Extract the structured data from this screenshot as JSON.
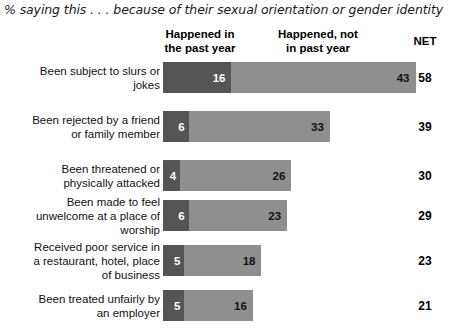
{
  "title": "% saying this . . . because of their sexual orientation or gender identity",
  "headers": {
    "happened": "Happened in\nthe past year",
    "happened_line1": "Happened in",
    "happened_line2": "the past year",
    "not_happened_line1": "Happened, not",
    "not_happened_line2": "in past year",
    "net": "NET"
  },
  "colors": {
    "past_year": "#555555",
    "not_past_year": "#8f8f8f",
    "background": "#ffffff",
    "text": "#111111"
  },
  "chart_data": {
    "type": "bar",
    "title": "% saying this . . . because of their sexual orientation or gender identity",
    "orientation": "horizontal",
    "stacked": true,
    "xlabel": "",
    "ylabel": "",
    "grid": false,
    "legend": "column-headers",
    "xlim": [
      0,
      60
    ],
    "categories": [
      "Been subject to slurs or jokes",
      "Been rejected by a friend or family member",
      "Been threatened or physically attacked",
      "Been made to feel unwelcome at a place of worship",
      "Received poor service in a restaurant, hotel, place of business",
      "Been treated unfairly by an employer"
    ],
    "series": [
      {
        "name": "Happened in the past year",
        "color": "#555555",
        "values": [
          16,
          6,
          4,
          6,
          5,
          5
        ]
      },
      {
        "name": "Happened, not in past year",
        "color": "#8f8f8f",
        "values": [
          43,
          33,
          26,
          23,
          18,
          16
        ]
      }
    ],
    "net_label": "NET",
    "net": [
      58,
      39,
      30,
      29,
      23,
      21
    ]
  },
  "rows": [
    {
      "label_line1": "Been subject to slurs or",
      "label_line2": "jokes",
      "past": 16,
      "not_past": 43,
      "net": 58
    },
    {
      "label_line1": "Been rejected by a friend",
      "label_line2": "or family member",
      "past": 6,
      "not_past": 33,
      "net": 39
    },
    {
      "label_line1": "Been threatened or",
      "label_line2": "physically attacked",
      "past": 4,
      "not_past": 26,
      "net": 30
    },
    {
      "label_line1": "Been made to feel",
      "label_line2": "unwelcome at a place of",
      "label_line3": "worship",
      "past": 6,
      "not_past": 23,
      "net": 29
    },
    {
      "label_line1": "Received poor service in",
      "label_line2": "a restaurant, hotel, place",
      "label_line3": "of business",
      "past": 5,
      "not_past": 18,
      "net": 23
    },
    {
      "label_line1": "Been treated unfairly by",
      "label_line2": "an employer",
      "past": 5,
      "not_past": 16,
      "net": 21
    }
  ]
}
